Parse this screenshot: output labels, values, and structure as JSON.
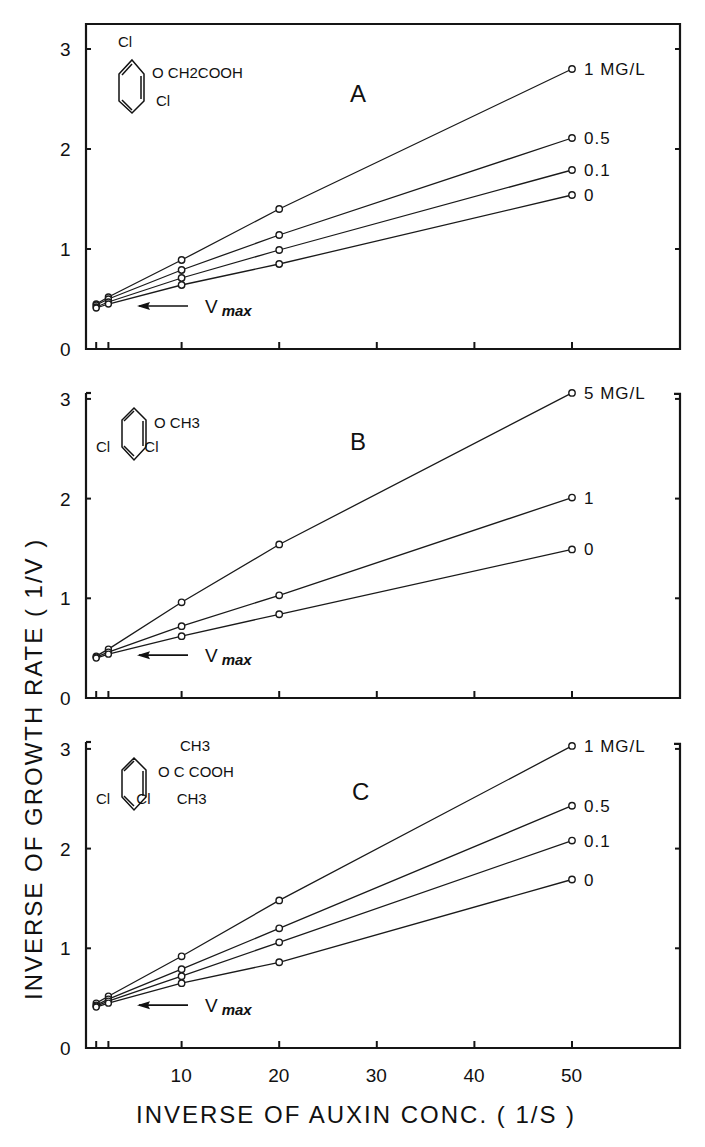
{
  "figure": {
    "y_axis_title": "INVERSE OF GROWTH RATE  ( 1/V )",
    "x_axis_title": "INVERSE OF AUXIN CONC.  ( 1/S )",
    "vmax_label": "V",
    "vmax_sub": "max",
    "y_ticks": [
      "0",
      "1",
      "2",
      "3"
    ],
    "x_ticks": [
      "10",
      "20",
      "30",
      "40",
      "50"
    ]
  },
  "chart_data": [
    {
      "type": "line",
      "panel": "A",
      "title": "A",
      "compound": {
        "substituents_top": "Cl",
        "side_chain": "O CH2COOH",
        "substituents_bottom": "Cl"
      },
      "xlabel": "INVERSE OF AUXIN CONC. (1/S)",
      "ylabel": "INVERSE OF GROWTH RATE (1/V)",
      "xlim": [
        0,
        60
      ],
      "ylim": [
        0,
        3.2
      ],
      "x": [
        1.25,
        2.5,
        10,
        20,
        50
      ],
      "series": [
        {
          "name": "1 MG/L",
          "label": "1 MG/L",
          "values": [
            0.45,
            0.52,
            0.89,
            1.4,
            2.8
          ]
        },
        {
          "name": "0.5",
          "label": "0.5",
          "values": [
            0.44,
            0.5,
            0.79,
            1.14,
            2.11
          ]
        },
        {
          "name": "0.1",
          "label": "0.1",
          "values": [
            0.42,
            0.47,
            0.71,
            0.99,
            1.79
          ]
        },
        {
          "name": "0",
          "label": "0",
          "values": [
            0.41,
            0.45,
            0.64,
            0.85,
            1.54
          ]
        }
      ],
      "annotation": "Vmax (arrow pointing to y-intercept ≈ 0.42)",
      "grid": false
    },
    {
      "type": "line",
      "panel": "B",
      "title": "B",
      "compound": {
        "substituents_top": "",
        "side_chain": "O CH3",
        "substituents_bottom": "Cl   Cl"
      },
      "xlabel": "INVERSE OF AUXIN CONC. (1/S)",
      "ylabel": "INVERSE OF GROWTH RATE (1/V)",
      "xlim": [
        0,
        60
      ],
      "ylim": [
        0,
        3.2
      ],
      "x": [
        1.25,
        2.5,
        10,
        20,
        50
      ],
      "series": [
        {
          "name": "5 MG/L",
          "label": "5 MG/L",
          "values": [
            0.42,
            0.49,
            0.96,
            1.54,
            3.06
          ]
        },
        {
          "name": "1",
          "label": "1",
          "values": [
            0.41,
            0.46,
            0.72,
            1.03,
            2.01
          ]
        },
        {
          "name": "0",
          "label": "0",
          "values": [
            0.4,
            0.44,
            0.62,
            0.84,
            1.49
          ]
        }
      ],
      "annotation": "Vmax (arrow pointing to y-intercept ≈ 0.40)",
      "grid": false
    },
    {
      "type": "line",
      "panel": "C",
      "title": "C",
      "compound": {
        "substituents_top": "CH3",
        "side_chain": "O C COOH",
        "substituents_bottom": "Cl   Cl CH3"
      },
      "xlabel": "INVERSE OF AUXIN CONC. (1/S)",
      "ylabel": "INVERSE OF GROWTH RATE (1/V)",
      "xlim": [
        0,
        60
      ],
      "ylim": [
        0,
        3.2
      ],
      "x": [
        1.25,
        2.5,
        10,
        20,
        50
      ],
      "series": [
        {
          "name": "1 MG/L",
          "label": "1 MG/L",
          "values": [
            0.45,
            0.52,
            0.92,
            1.48,
            3.03
          ]
        },
        {
          "name": "0.5",
          "label": "0.5",
          "values": [
            0.43,
            0.49,
            0.79,
            1.2,
            2.43
          ]
        },
        {
          "name": "0.1",
          "label": "0.1",
          "values": [
            0.42,
            0.47,
            0.72,
            1.06,
            2.08
          ]
        },
        {
          "name": "0",
          "label": "0",
          "values": [
            0.41,
            0.45,
            0.65,
            0.86,
            1.69
          ]
        }
      ],
      "annotation": "Vmax (arrow pointing to y-intercept ≈ 0.42)",
      "grid": false
    }
  ]
}
